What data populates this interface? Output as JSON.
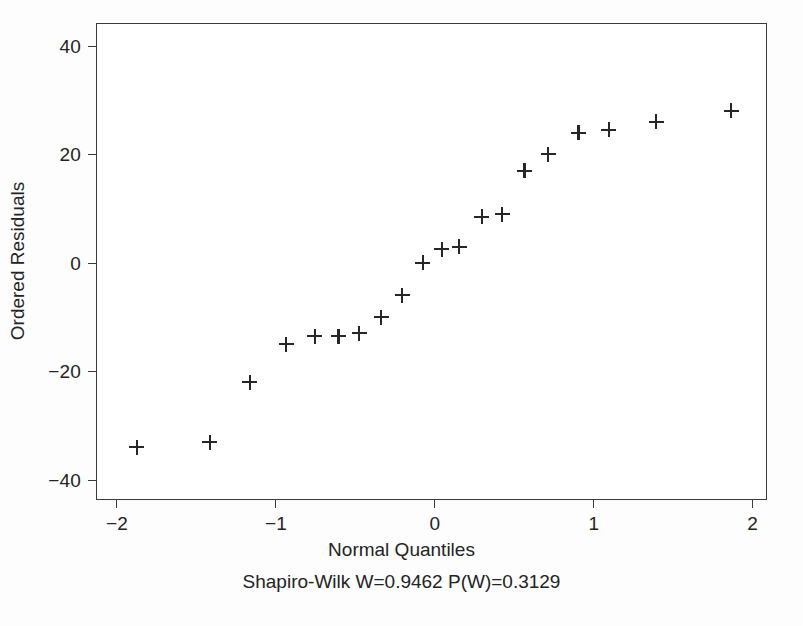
{
  "chart_data": {
    "type": "scatter",
    "title": "",
    "xlabel": "Normal Quantiles",
    "ylabel": "Ordered Residuals",
    "annotation": "Shapiro-Wilk W=0.9462  P(W)=0.3129",
    "statistics": {
      "test": "Shapiro-Wilk",
      "W_label": "W=0.9462",
      "W": 0.9462,
      "P_label": "P(W)=0.3129",
      "P": 0.3129
    },
    "grid": false,
    "legend": false,
    "legend_position": "none",
    "marker": "plus",
    "marker_color": "#262626",
    "xlim": [
      -2.12,
      2.09
    ],
    "ylim": [
      -43.5,
      44.0
    ],
    "xticks": [
      -2,
      -1,
      0,
      1,
      2
    ],
    "xtick_labels": [
      "−2",
      "−1",
      "0",
      "1",
      "2"
    ],
    "yticks": [
      40,
      20,
      0,
      -20,
      -40
    ],
    "ytick_labels": [
      "40",
      "20",
      "0",
      "−20",
      "−40"
    ],
    "n_points": 20,
    "x": [
      -1.87,
      -1.41,
      -1.16,
      -0.93,
      -0.75,
      -0.6,
      -0.47,
      -0.33,
      -0.2,
      -0.07,
      0.05,
      0.16,
      0.3,
      0.43,
      0.57,
      0.72,
      0.91,
      1.1,
      1.4,
      1.87
    ],
    "y": [
      -34.0,
      -33.0,
      -22.0,
      -15.0,
      -13.5,
      -13.5,
      -13.0,
      -10.0,
      -6.0,
      0.0,
      2.5,
      3.0,
      8.5,
      9.0,
      17.0,
      20.0,
      24.0,
      24.5,
      26.0,
      28.0
    ],
    "points": [
      {
        "x": -1.87,
        "y": -34.0
      },
      {
        "x": -1.41,
        "y": -33.0
      },
      {
        "x": -1.16,
        "y": -22.0
      },
      {
        "x": -0.93,
        "y": -15.0
      },
      {
        "x": -0.75,
        "y": -13.5
      },
      {
        "x": -0.6,
        "y": -13.5
      },
      {
        "x": -0.47,
        "y": -13.0
      },
      {
        "x": -0.33,
        "y": -10.0
      },
      {
        "x": -0.2,
        "y": -6.0
      },
      {
        "x": -0.07,
        "y": 0.0
      },
      {
        "x": 0.05,
        "y": 2.5
      },
      {
        "x": 0.16,
        "y": 3.0
      },
      {
        "x": 0.3,
        "y": 8.5
      },
      {
        "x": 0.43,
        "y": 9.0
      },
      {
        "x": 0.57,
        "y": 17.0
      },
      {
        "x": 0.72,
        "y": 20.0
      },
      {
        "x": 0.91,
        "y": 24.0
      },
      {
        "x": 1.1,
        "y": 24.5
      },
      {
        "x": 1.4,
        "y": 26.0
      },
      {
        "x": 1.87,
        "y": 28.0
      }
    ]
  }
}
